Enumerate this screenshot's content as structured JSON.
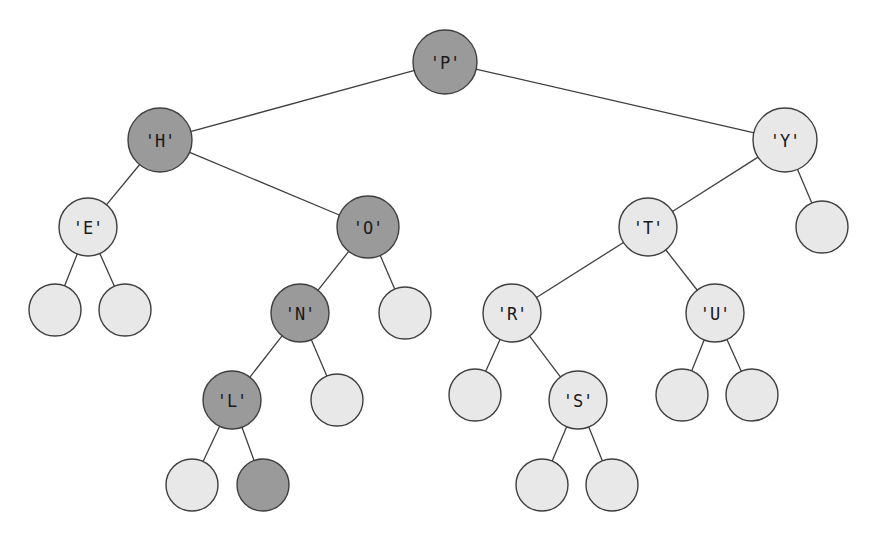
{
  "figure": {
    "width": 880,
    "height": 539,
    "background": "#ffffff"
  },
  "style": {
    "fill_light": "#e8e8e8",
    "fill_dark": "#9a9a9a",
    "stroke": "#3f3f3f",
    "label_color": "#1a1a1a",
    "edge_color": "#3f3f3f",
    "internal_radius": 32,
    "leaf_radius": 26
  },
  "chart_data": {
    "type": "diagram",
    "subtype": "binary-search-tree",
    "legend": [
      {
        "name": "dark-node",
        "color": "#9a9a9a",
        "meaning": "shaded node"
      },
      {
        "name": "light-node",
        "color": "#e8e8e8",
        "meaning": "unshaded node"
      }
    ],
    "labels_in_reading_order": [
      "'P'",
      "'H'",
      "'Y'",
      "'E'",
      "'O'",
      "'T'",
      "'N'",
      "'R'",
      "'U'",
      "'L'",
      "'S'"
    ],
    "dark_labelled_nodes": [
      "'P'",
      "'H'",
      "'O'",
      "'N'",
      "'L'"
    ],
    "light_labelled_nodes": [
      "'E'",
      "'Y'",
      "'T'",
      "'R'",
      "'U'",
      "'S'"
    ],
    "node_count": 24,
    "labelled_node_count": 11,
    "leaf_count": 13,
    "depth": 6,
    "nodes": [
      {
        "id": "P",
        "label": "'P'",
        "x": 445,
        "y": 62,
        "r": 32,
        "shade": "dark",
        "kind": "internal"
      },
      {
        "id": "H",
        "label": "'H'",
        "x": 160,
        "y": 140,
        "r": 32,
        "shade": "dark",
        "kind": "internal"
      },
      {
        "id": "Y",
        "label": "'Y'",
        "x": 785,
        "y": 140,
        "r": 32,
        "shade": "light",
        "kind": "internal"
      },
      {
        "id": "E",
        "label": "'E'",
        "x": 88,
        "y": 227,
        "r": 29,
        "shade": "light",
        "kind": "internal"
      },
      {
        "id": "O",
        "label": "'O'",
        "x": 368,
        "y": 227,
        "r": 31,
        "shade": "dark",
        "kind": "internal"
      },
      {
        "id": "T",
        "label": "'T'",
        "x": 648,
        "y": 227,
        "r": 29,
        "shade": "light",
        "kind": "internal"
      },
      {
        "id": "Yr",
        "label": "",
        "x": 822,
        "y": 227,
        "r": 26,
        "shade": "light",
        "kind": "leaf"
      },
      {
        "id": "El",
        "label": "",
        "x": 55,
        "y": 310,
        "r": 26,
        "shade": "light",
        "kind": "leaf"
      },
      {
        "id": "Er",
        "label": "",
        "x": 125,
        "y": 310,
        "r": 26,
        "shade": "light",
        "kind": "leaf"
      },
      {
        "id": "N",
        "label": "'N'",
        "x": 300,
        "y": 313,
        "r": 29,
        "shade": "dark",
        "kind": "internal"
      },
      {
        "id": "Or",
        "label": "",
        "x": 405,
        "y": 313,
        "r": 26,
        "shade": "light",
        "kind": "leaf"
      },
      {
        "id": "R",
        "label": "'R'",
        "x": 512,
        "y": 313,
        "r": 29,
        "shade": "light",
        "kind": "internal"
      },
      {
        "id": "U",
        "label": "'U'",
        "x": 715,
        "y": 313,
        "r": 29,
        "shade": "light",
        "kind": "internal"
      },
      {
        "id": "L",
        "label": "'L'",
        "x": 232,
        "y": 400,
        "r": 29,
        "shade": "dark",
        "kind": "internal"
      },
      {
        "id": "Nr",
        "label": "",
        "x": 337,
        "y": 400,
        "r": 26,
        "shade": "light",
        "kind": "leaf"
      },
      {
        "id": "Rl",
        "label": "",
        "x": 475,
        "y": 395,
        "r": 26,
        "shade": "light",
        "kind": "leaf"
      },
      {
        "id": "S",
        "label": "'S'",
        "x": 578,
        "y": 400,
        "r": 29,
        "shade": "light",
        "kind": "internal"
      },
      {
        "id": "Ul",
        "label": "",
        "x": 682,
        "y": 395,
        "r": 26,
        "shade": "light",
        "kind": "leaf"
      },
      {
        "id": "Ur",
        "label": "",
        "x": 752,
        "y": 395,
        "r": 26,
        "shade": "light",
        "kind": "leaf"
      },
      {
        "id": "Ll",
        "label": "",
        "x": 192,
        "y": 485,
        "r": 26,
        "shade": "light",
        "kind": "leaf"
      },
      {
        "id": "Lr",
        "label": "",
        "x": 263,
        "y": 485,
        "r": 26,
        "shade": "dark",
        "kind": "leaf"
      },
      {
        "id": "Sl",
        "label": "",
        "x": 542,
        "y": 485,
        "r": 26,
        "shade": "light",
        "kind": "leaf"
      },
      {
        "id": "Sr",
        "label": "",
        "x": 612,
        "y": 485,
        "r": 26,
        "shade": "light",
        "kind": "leaf"
      }
    ],
    "edges": [
      {
        "from": "P",
        "to": "H"
      },
      {
        "from": "P",
        "to": "Y"
      },
      {
        "from": "H",
        "to": "E"
      },
      {
        "from": "H",
        "to": "O"
      },
      {
        "from": "Y",
        "to": "T"
      },
      {
        "from": "Y",
        "to": "Yr"
      },
      {
        "from": "E",
        "to": "El"
      },
      {
        "from": "E",
        "to": "Er"
      },
      {
        "from": "O",
        "to": "N"
      },
      {
        "from": "O",
        "to": "Or"
      },
      {
        "from": "T",
        "to": "R"
      },
      {
        "from": "T",
        "to": "U"
      },
      {
        "from": "N",
        "to": "L"
      },
      {
        "from": "N",
        "to": "Nr"
      },
      {
        "from": "R",
        "to": "Rl"
      },
      {
        "from": "R",
        "to": "S"
      },
      {
        "from": "U",
        "to": "Ul"
      },
      {
        "from": "U",
        "to": "Ur"
      },
      {
        "from": "L",
        "to": "Ll"
      },
      {
        "from": "L",
        "to": "Lr"
      },
      {
        "from": "S",
        "to": "Sl"
      },
      {
        "from": "S",
        "to": "Sr"
      }
    ]
  }
}
